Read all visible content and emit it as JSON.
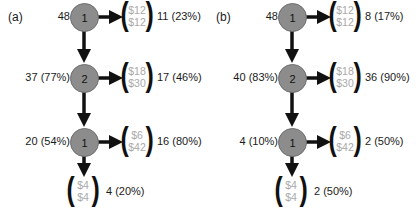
{
  "panels": [
    {
      "label": "(a)",
      "nodes": [
        {
          "id": "1",
          "left_label": "48",
          "offer": {
            "top": "$12",
            "bottom": "$12"
          },
          "right_label": "11 (23%)"
        },
        {
          "id": "2",
          "left_label": "37 (77%)",
          "offer": {
            "top": "$18",
            "bottom": "$30"
          },
          "right_label": "17 (46%)"
        },
        {
          "id": "1",
          "left_label": "20 (54%)",
          "offer": {
            "top": "$6",
            "bottom": "$42"
          },
          "right_label": "16 (80%)"
        }
      ],
      "terminal": {
        "offer": {
          "top": "$4",
          "bottom": "$4"
        },
        "right_label": "4 (20%)"
      }
    },
    {
      "label": "(b)",
      "nodes": [
        {
          "id": "1",
          "left_label": "48",
          "offer": {
            "top": "$12",
            "bottom": "$12"
          },
          "right_label": "8 (17%)"
        },
        {
          "id": "2",
          "left_label": "40 (83%)",
          "offer": {
            "top": "$18",
            "bottom": "$30"
          },
          "right_label": "36 (90%)"
        },
        {
          "id": "1",
          "left_label": "4 (10%)",
          "offer": {
            "top": "$6",
            "bottom": "$42"
          },
          "right_label": "2 (50%)"
        }
      ],
      "terminal": {
        "offer": {
          "top": "$4",
          "bottom": "$4"
        },
        "right_label": "2 (50%)"
      }
    }
  ],
  "colors": {
    "node_fill": "#8c8c8c",
    "offer_text": "#a9a9a9",
    "arrow": "#111111"
  }
}
